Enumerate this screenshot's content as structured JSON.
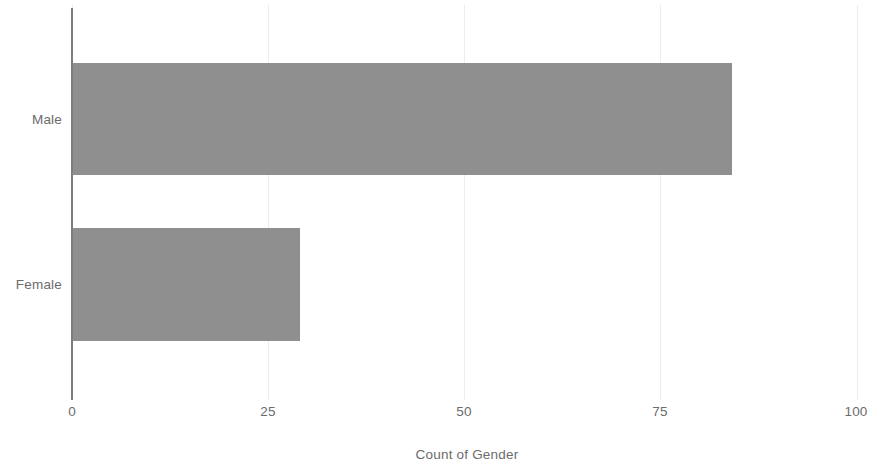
{
  "chart_data": {
    "type": "bar",
    "orientation": "horizontal",
    "title": "",
    "subtitle": "",
    "xlabel": "Count of Gender",
    "ylabel": "",
    "categories": [
      "Male",
      "Female"
    ],
    "values": [
      84,
      29
    ],
    "series": [
      {
        "name": "Count of Gender",
        "values": [
          84,
          29
        ]
      }
    ],
    "xlim": [
      0,
      100
    ],
    "xticks": [
      0,
      25,
      50,
      75,
      100
    ],
    "xtick_labels": [
      "0",
      "25",
      "50",
      "75",
      "100"
    ],
    "ytick_labels": [
      "Male",
      "Female"
    ],
    "grid": "vertical-only",
    "legend": "none",
    "bar_color": "#8f8f8f",
    "gridline_color": "#ececec",
    "axis_color": "#7d7d7d",
    "text_color": "#6b6b6b",
    "background_color": "#ffffff",
    "annotations": []
  },
  "axis": {
    "x_title": "Count of Gender",
    "tick_0": "0",
    "tick_25": "25",
    "tick_50": "50",
    "tick_75": "75",
    "tick_100": "100"
  },
  "categories": {
    "male": "Male",
    "female": "Female"
  }
}
